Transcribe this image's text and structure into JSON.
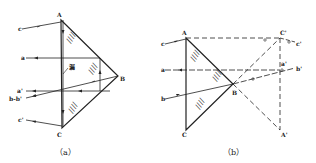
{
  "figure_a": {
    "caption": "（a）",
    "vertices": {
      "A": "A",
      "B": "B",
      "C": "C"
    },
    "rays_in": {
      "c": "c",
      "a": "a"
    },
    "rays_out": {
      "a_prime": "a'",
      "b_b_prime": "b-b'",
      "c_prime": "c'"
    },
    "surface_label": "漏",
    "hatch_mark": "////"
  },
  "figure_b": {
    "caption": "（b）",
    "vertices": {
      "A": "A",
      "B": "B",
      "C": "C",
      "C_prime": "C'",
      "A_prime": "A'"
    },
    "rays_in": {
      "c": "c",
      "a": "a",
      "b": "b"
    },
    "rays_out": {
      "c_prime": "c'",
      "a_prime": "a'",
      "b_prime": "b'"
    },
    "hatch_mark": "////"
  }
}
